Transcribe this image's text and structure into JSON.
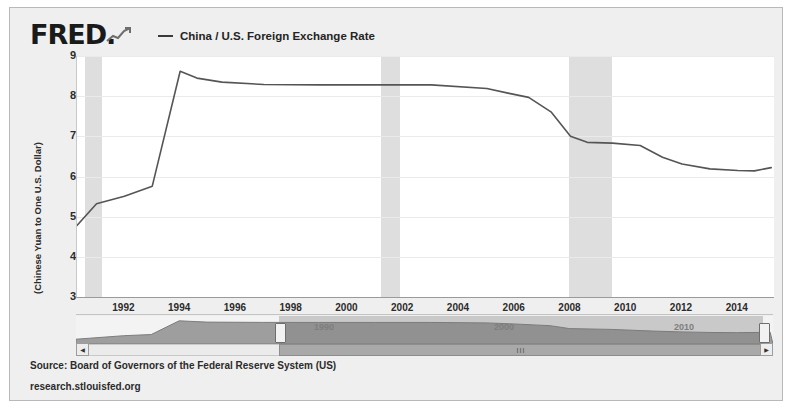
{
  "brand": {
    "name": "FRED",
    "dot": ".",
    "spark_icon": "sparkline-icon"
  },
  "legend": {
    "swatch_icon": "line-swatch-icon",
    "label": "China / U.S. Foreign Exchange Rate"
  },
  "footer": {
    "source": "Source: Board of Governors of the Federal Reserve System (US)",
    "url": "research.stlouisfed.org"
  },
  "slider": {
    "left_arrow_icon": "left-arrow-icon",
    "right_arrow_icon": "right-arrow-icon",
    "grip_icon": "grip-icon",
    "grip_glyph": "III",
    "left_handle_icon": "left-range-handle-icon",
    "right_handle_icon": "right-range-handle-icon",
    "decade_labels": [
      "1990",
      "2000",
      "2010"
    ],
    "selection_start": "1990",
    "selection_end": "2015"
  },
  "chart_data": {
    "type": "line",
    "title": "China / U.S. Foreign Exchange Rate",
    "xlabel": "",
    "ylabel": "(Chinese Yuan to One U.S. Dollar)",
    "xlim": [
      1990.3,
      2015.3
    ],
    "ylim": [
      3,
      9
    ],
    "yticks": [
      9,
      8,
      7,
      6,
      5,
      4,
      3
    ],
    "xticks": [
      1992,
      1994,
      1996,
      1998,
      2000,
      2002,
      2004,
      2006,
      2008,
      2010,
      2012,
      2014
    ],
    "grid": true,
    "legend_position": "top",
    "line_color": "#555555",
    "recession_color": "#dedede",
    "recessions": [
      {
        "start": 1990.6,
        "end": 1991.2
      },
      {
        "start": 2001.2,
        "end": 2001.9
      },
      {
        "start": 2007.95,
        "end": 2009.5
      }
    ],
    "series": [
      {
        "name": "China / U.S. Foreign Exchange Rate",
        "x": [
          1990.3,
          1991.0,
          1992.0,
          1993.0,
          1994.0,
          1994.6,
          1995.5,
          1997.0,
          1999.0,
          2001.0,
          2003.0,
          2005.0,
          2005.8,
          2006.5,
          2007.3,
          2008.0,
          2008.6,
          2009.5,
          2010.5,
          2011.3,
          2012.0,
          2013.0,
          2014.0,
          2014.6,
          2015.2
        ],
        "values": [
          4.78,
          5.32,
          5.51,
          5.76,
          8.62,
          8.45,
          8.35,
          8.29,
          8.28,
          8.28,
          8.28,
          8.19,
          8.07,
          7.97,
          7.61,
          7.0,
          6.85,
          6.83,
          6.77,
          6.48,
          6.31,
          6.19,
          6.15,
          6.14,
          6.22
        ]
      }
    ],
    "mini_series": {
      "x": [
        1990.3,
        1992,
        1993,
        1994,
        1995,
        1997,
        1999,
        2001,
        2003,
        2005,
        2006,
        2007.3,
        2008,
        2009.5,
        2011,
        2012,
        2013,
        2014,
        2015.2
      ],
      "values": [
        4.78,
        5.51,
        5.76,
        8.62,
        8.35,
        8.29,
        8.28,
        8.28,
        8.28,
        8.19,
        7.97,
        7.61,
        7.0,
        6.83,
        6.48,
        6.31,
        6.19,
        6.15,
        6.22
      ]
    }
  }
}
